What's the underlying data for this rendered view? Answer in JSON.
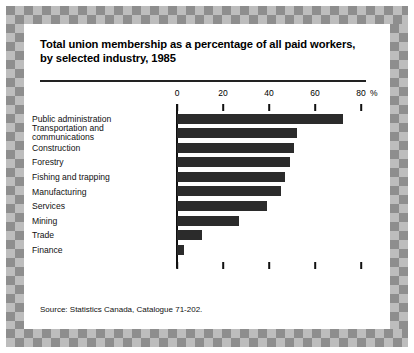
{
  "figure": {
    "title_line1": "Total union membership as a percentage of all paid workers,",
    "title_line2": "by selected industry, 1985",
    "source": "Source:   Statistics Canada, Catalogue 71-202.",
    "colors": {
      "bar": "#2b2b2b",
      "axis": "#111111",
      "border_dark": "#8e8e8e",
      "border_light": "#bdbdbd",
      "panel": "#ffffff"
    }
  },
  "chart_data": {
    "type": "bar",
    "orientation": "horizontal",
    "title": "Total union membership as a percentage of all paid workers, by selected industry, 1985",
    "xlabel": "",
    "ylabel": "",
    "unit": "%",
    "xlim": [
      0,
      80
    ],
    "xticks": [
      0,
      20,
      40,
      60,
      80
    ],
    "xtick_labels": [
      "0",
      "20",
      "40",
      "60",
      "80"
    ],
    "grid": false,
    "legend": "none",
    "categories": [
      "Public administration",
      "Transportation and communications",
      "Construction",
      "Forestry",
      "Fishing and trapping",
      "Manufacturing",
      "Services",
      "Mining",
      "Trade",
      "Finance"
    ],
    "values": [
      72,
      52,
      51,
      49,
      47,
      45,
      39,
      27,
      11,
      3
    ],
    "series": [
      {
        "name": "Union membership rate",
        "values": [
          72,
          52,
          51,
          49,
          47,
          45,
          39,
          27,
          11,
          3
        ]
      }
    ]
  },
  "labels": {
    "rows": [
      {
        "text": "Public administration",
        "line2": ""
      },
      {
        "text": "Transportation and",
        "line2": "communications"
      },
      {
        "text": "Construction",
        "line2": ""
      },
      {
        "text": "Forestry",
        "line2": ""
      },
      {
        "text": "Fishing and trapping",
        "line2": ""
      },
      {
        "text": "Manufacturing",
        "line2": ""
      },
      {
        "text": "Services",
        "line2": ""
      },
      {
        "text": "Mining",
        "line2": ""
      },
      {
        "text": "Trade",
        "line2": ""
      },
      {
        "text": "Finance",
        "line2": ""
      }
    ]
  }
}
